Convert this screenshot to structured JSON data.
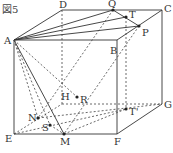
{
  "figure": {
    "title": "図5",
    "labels": {
      "A": "A",
      "B": "B",
      "C": "C",
      "D": "D",
      "E": "E",
      "F": "F",
      "G": "G",
      "H": "H",
      "M": "M",
      "N": "N",
      "P": "P",
      "Q": "Q",
      "R": "R",
      "S": "S",
      "T": "T",
      "T2": "T'"
    }
  }
}
